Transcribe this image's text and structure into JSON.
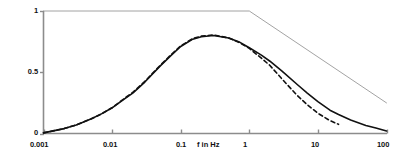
{
  "chart_data": {
    "type": "line",
    "title": "",
    "subtitle": "",
    "xlabel": "f in Hz",
    "ylabel": "",
    "xscale": "log",
    "yscale": "linear",
    "xlim": [
      0.001,
      100
    ],
    "ylim": [
      0,
      1
    ],
    "grid": false,
    "legend_position": "none",
    "xticks": [
      0.001,
      0.01,
      0.1,
      1,
      10,
      100
    ],
    "xticklabels": [
      "0.001",
      "0.01",
      "0.1",
      "1",
      "10",
      "100"
    ],
    "yticks": [
      0,
      0.5,
      1
    ],
    "yticklabels": [
      "0",
      "0.5",
      "1"
    ],
    "series": [
      {
        "name": "envelope-limit",
        "style": "solid",
        "color": "#8c8c8c",
        "linewidth": 0.8,
        "x": [
          0.001,
          1,
          100
        ],
        "y": [
          1.0,
          1.0,
          0.25
        ]
      },
      {
        "name": "response-solid",
        "style": "solid",
        "color": "#111111",
        "linewidth": 1.6,
        "x": [
          0.001,
          0.002,
          0.003,
          0.005,
          0.007,
          0.01,
          0.015,
          0.02,
          0.03,
          0.05,
          0.07,
          0.1,
          0.15,
          0.2,
          0.3,
          0.5,
          0.7,
          1,
          1.5,
          2,
          3,
          5,
          7,
          10,
          15,
          20,
          30,
          50,
          70,
          100
        ],
        "y": [
          0.005,
          0.04,
          0.07,
          0.12,
          0.16,
          0.21,
          0.28,
          0.33,
          0.42,
          0.55,
          0.63,
          0.71,
          0.77,
          0.79,
          0.8,
          0.78,
          0.75,
          0.7,
          0.64,
          0.59,
          0.51,
          0.4,
          0.33,
          0.26,
          0.19,
          0.155,
          0.11,
          0.065,
          0.045,
          0.02
        ]
      },
      {
        "name": "response-dashed",
        "style": "dashed",
        "color": "#111111",
        "linewidth": 1.6,
        "x": [
          0.001,
          0.002,
          0.003,
          0.005,
          0.007,
          0.01,
          0.015,
          0.02,
          0.03,
          0.05,
          0.07,
          0.1,
          0.15,
          0.2,
          0.3,
          0.5,
          0.7,
          1,
          1.5,
          2,
          3,
          5,
          7,
          10,
          15,
          20
        ],
        "y": [
          0.005,
          0.04,
          0.07,
          0.12,
          0.16,
          0.21,
          0.285,
          0.335,
          0.425,
          0.555,
          0.635,
          0.715,
          0.775,
          0.795,
          0.805,
          0.78,
          0.745,
          0.695,
          0.615,
          0.555,
          0.445,
          0.31,
          0.235,
          0.165,
          0.105,
          0.075
        ]
      }
    ]
  },
  "axis": {
    "x_label_text": "f in Hz",
    "axis_color": "#8c8c8c"
  }
}
